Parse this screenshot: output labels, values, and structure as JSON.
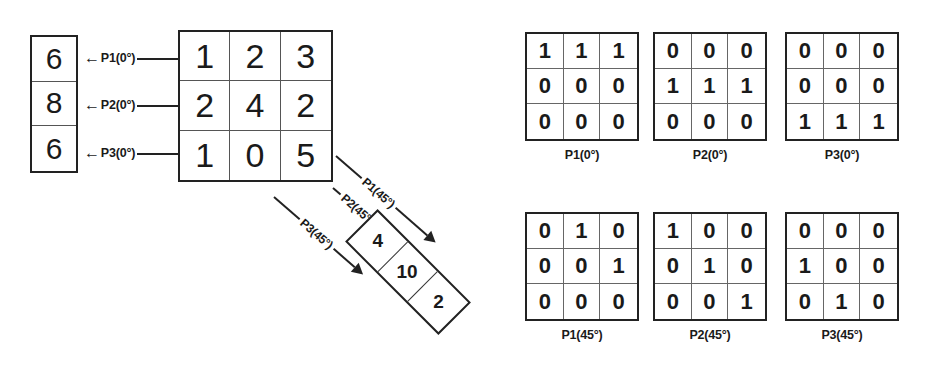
{
  "figure": {
    "background_color": "#ffffff",
    "line_color": "#222222"
  },
  "source_vector": {
    "name": "P-vector-0deg",
    "values": [
      "6",
      "8",
      "6"
    ]
  },
  "image_matrix": {
    "name": "input-image-matrix",
    "rows": [
      [
        "1",
        "2",
        "3"
      ],
      [
        "2",
        "4",
        "2"
      ],
      [
        "1",
        "0",
        "5"
      ]
    ]
  },
  "horizontal_arrows": [
    {
      "head": "←",
      "label": "P1(0°)"
    },
    {
      "head": "←",
      "label": "P2(0°)"
    },
    {
      "head": "←",
      "label": "P3(0°)"
    }
  ],
  "diagonal_arrows": [
    {
      "label": "P1(45°)"
    },
    {
      "label": "P2(45°)"
    },
    {
      "label": "P3(45°)"
    }
  ],
  "rotated_vector": {
    "name": "P-vector-45deg",
    "values": [
      "4",
      "10",
      "2"
    ]
  },
  "binary_matrices": [
    {
      "label": "P1(0°)",
      "rows": [
        [
          "1",
          "1",
          "1"
        ],
        [
          "0",
          "0",
          "0"
        ],
        [
          "0",
          "0",
          "0"
        ]
      ]
    },
    {
      "label": "P2(0°)",
      "rows": [
        [
          "0",
          "0",
          "0"
        ],
        [
          "1",
          "1",
          "1"
        ],
        [
          "0",
          "0",
          "0"
        ]
      ]
    },
    {
      "label": "P3(0°)",
      "rows": [
        [
          "0",
          "0",
          "0"
        ],
        [
          "0",
          "0",
          "0"
        ],
        [
          "1",
          "1",
          "1"
        ]
      ]
    },
    {
      "label": "P1(45°)",
      "rows": [
        [
          "0",
          "1",
          "0"
        ],
        [
          "0",
          "0",
          "1"
        ],
        [
          "0",
          "0",
          "0"
        ]
      ]
    },
    {
      "label": "P2(45°)",
      "rows": [
        [
          "1",
          "0",
          "0"
        ],
        [
          "0",
          "1",
          "0"
        ],
        [
          "0",
          "0",
          "1"
        ]
      ]
    },
    {
      "label": "P3(45°)",
      "rows": [
        [
          "0",
          "0",
          "0"
        ],
        [
          "1",
          "0",
          "0"
        ],
        [
          "0",
          "1",
          "0"
        ]
      ]
    }
  ]
}
